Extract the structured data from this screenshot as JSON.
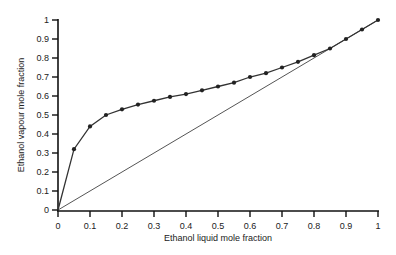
{
  "chart_data": {
    "type": "line",
    "title": "",
    "xlabel": "Ethanol liquid mole fraction",
    "ylabel": "Ethanol vapour mole fraction",
    "xlim": [
      0,
      1
    ],
    "ylim": [
      0,
      1
    ],
    "grid": false,
    "legend": "none",
    "x_ticks": [
      "0",
      "0.1",
      "0.2",
      "0.3",
      "0.4",
      "0.5",
      "0.6",
      "0.7",
      "0.8",
      "0.9",
      "1"
    ],
    "y_ticks": [
      "0",
      "0.1",
      "0.2",
      "0.3",
      "0.4",
      "0.5",
      "0.6",
      "0.7",
      "0.8",
      "0.9",
      "1"
    ],
    "series": [
      {
        "name": "Equilibrium curve",
        "markers": true,
        "x": [
          0,
          0.05,
          0.1,
          0.15,
          0.2,
          0.25,
          0.3,
          0.35,
          0.4,
          0.45,
          0.5,
          0.55,
          0.6,
          0.65,
          0.7,
          0.75,
          0.8,
          0.85,
          0.9,
          0.95,
          1
        ],
        "y": [
          0,
          0.32,
          0.44,
          0.5,
          0.53,
          0.555,
          0.575,
          0.595,
          0.61,
          0.63,
          0.65,
          0.67,
          0.7,
          0.72,
          0.75,
          0.78,
          0.815,
          0.85,
          0.9,
          0.95,
          1
        ]
      },
      {
        "name": "y = x reference line",
        "markers": false,
        "x": [
          0,
          1
        ],
        "y": [
          0,
          1
        ]
      }
    ],
    "colors": {
      "curve": "#333333",
      "diagonal": "#555555",
      "axis": "#111111"
    }
  }
}
